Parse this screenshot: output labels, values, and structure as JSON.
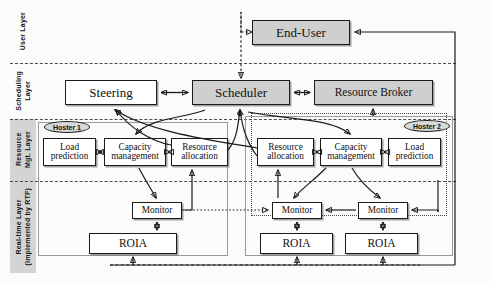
{
  "diagram": {
    "type": "block-diagram",
    "colors": {
      "box_fill": "#ffffff",
      "box_fill_highlight": "#cfcfcf",
      "rail_shade": "#d4d4d4",
      "stroke": "#1a1a1a",
      "hoster_border": "#9a9a9a"
    }
  },
  "layers": [
    {
      "id": "user",
      "label": "User Layer",
      "shaded": false
    },
    {
      "id": "scheduling",
      "label": "Scheduling\nLayer",
      "shaded": false
    },
    {
      "id": "resource",
      "label": "Resource\nMgt. Layer",
      "shaded": true
    },
    {
      "id": "realtime",
      "label": "Real-time Layer\n(implemented by RTF)",
      "shaded": true
    }
  ],
  "nodes": {
    "end_user": {
      "label": "End-User",
      "layer": "user",
      "highlight": true
    },
    "steering": {
      "label": "Steering",
      "layer": "scheduling",
      "highlight": false
    },
    "scheduler": {
      "label": "Scheduler",
      "layer": "scheduling",
      "highlight": true
    },
    "resource_broker": {
      "label": "Resource Broker",
      "layer": "scheduling",
      "highlight": true
    },
    "h1_load": {
      "label": "Load\nprediction",
      "layer": "resource",
      "hoster": "hoster1"
    },
    "h1_cap": {
      "label": "Capacity\nmanagement",
      "layer": "resource",
      "hoster": "hoster1"
    },
    "h1_alloc": {
      "label": "Resource\nallocation",
      "layer": "resource",
      "hoster": "hoster1"
    },
    "h2_alloc": {
      "label": "Resource\nallocation",
      "layer": "resource",
      "hoster": "hoster2"
    },
    "h2_cap": {
      "label": "Capacity\nmanagement",
      "layer": "resource",
      "hoster": "hoster2"
    },
    "h2_load": {
      "label": "Load\nprediction",
      "layer": "resource",
      "hoster": "hoster2"
    },
    "mon1": {
      "label": "Monitor",
      "layer": "realtime",
      "hoster": "hoster1"
    },
    "mon2": {
      "label": "Monitor",
      "layer": "realtime",
      "hoster": "hoster2"
    },
    "mon3": {
      "label": "Monitor",
      "layer": "realtime",
      "hoster": "hoster2"
    },
    "roia1": {
      "label": "ROIA",
      "layer": "realtime",
      "hoster": "hoster1"
    },
    "roia2": {
      "label": "ROIA",
      "layer": "realtime",
      "hoster": "hoster2"
    },
    "roia3": {
      "label": "ROIA",
      "layer": "realtime",
      "hoster": "hoster2"
    }
  },
  "hosters": [
    {
      "id": "hoster1",
      "label": "Hoster 1"
    },
    {
      "id": "hoster2",
      "label": "Hoster 2"
    }
  ],
  "edges": [
    {
      "from": "end_user",
      "to": "scheduler",
      "style": "dashed",
      "arrows": "one"
    },
    {
      "from": "steering",
      "to": "scheduler",
      "style": "solid",
      "arrows": "both"
    },
    {
      "from": "scheduler",
      "to": "resource_broker",
      "style": "solid",
      "arrows": "both"
    },
    {
      "from": "resource_broker",
      "to": "hoster2",
      "style": "solid",
      "arrows": "one"
    },
    {
      "from": "roia_group",
      "to": "end_user",
      "style": "solid",
      "arrows": "one"
    },
    {
      "from": "h1_load",
      "to": "h1_cap",
      "style": "solid",
      "arrows": "both"
    },
    {
      "from": "h1_cap",
      "to": "h1_alloc",
      "style": "solid",
      "arrows": "both"
    },
    {
      "from": "h2_alloc",
      "to": "h2_cap",
      "style": "solid",
      "arrows": "both"
    },
    {
      "from": "h2_cap",
      "to": "h2_load",
      "style": "solid",
      "arrows": "both"
    },
    {
      "from": "h1_alloc",
      "to": "steering",
      "style": "solid",
      "arrows": "one"
    },
    {
      "from": "h2_alloc",
      "to": "steering",
      "style": "solid",
      "arrows": "one"
    },
    {
      "from": "h1_alloc",
      "to": "scheduler",
      "style": "solid",
      "arrows": "one"
    },
    {
      "from": "h2_alloc",
      "to": "scheduler",
      "style": "solid",
      "arrows": "one"
    },
    {
      "from": "scheduler",
      "to": "h1_cap",
      "style": "solid",
      "arrows": "one"
    },
    {
      "from": "scheduler",
      "to": "h2_cap",
      "style": "solid",
      "arrows": "one"
    },
    {
      "from": "h1_cap",
      "to": "mon1",
      "style": "solid",
      "arrows": "one"
    },
    {
      "from": "h2_cap",
      "to": "mon2",
      "style": "solid",
      "arrows": "one"
    },
    {
      "from": "h2_cap",
      "to": "mon3",
      "style": "solid",
      "arrows": "one"
    },
    {
      "from": "mon1",
      "to": "h1_alloc",
      "style": "solid",
      "arrows": "one"
    },
    {
      "from": "mon2",
      "to": "h2_alloc",
      "style": "solid",
      "arrows": "one"
    },
    {
      "from": "mon3",
      "to": "mon2",
      "style": "solid",
      "arrows": "one"
    },
    {
      "from": "mon1",
      "to": "roia1",
      "style": "solid",
      "arrows": "both"
    },
    {
      "from": "mon2",
      "to": "roia2",
      "style": "solid",
      "arrows": "both"
    },
    {
      "from": "mon3",
      "to": "roia3",
      "style": "solid",
      "arrows": "both"
    },
    {
      "from": "mon1",
      "to": "mon2",
      "style": "dotted",
      "arrows": "one"
    },
    {
      "from": "roia1",
      "to": "roia2",
      "style": "dashed",
      "arrows": "both"
    },
    {
      "from": "roia2",
      "to": "roia3",
      "style": "dashed",
      "arrows": "both"
    }
  ]
}
